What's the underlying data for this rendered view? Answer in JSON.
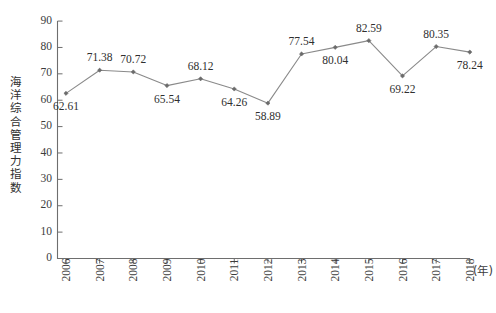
{
  "chart_data": {
    "type": "line",
    "title": "",
    "xlabel": "(年)",
    "ylabel": "海洋综合管理力指数",
    "categories": [
      "2006",
      "2007",
      "2008",
      "2009",
      "2010",
      "2011",
      "2012",
      "2013",
      "2014",
      "2015",
      "2016",
      "2017",
      "2018"
    ],
    "values": [
      62.61,
      71.38,
      70.72,
      65.54,
      68.12,
      64.26,
      58.89,
      77.54,
      80.04,
      82.59,
      69.22,
      80.35,
      78.24
    ],
    "point_labels": [
      "62.61",
      "71.38",
      "70.72",
      "65.54",
      "68.12",
      "64.26",
      "58.89",
      "77.54",
      "80.04",
      "82.59",
      "69.22",
      "80.35",
      "78.24"
    ],
    "label_positions": [
      "below",
      "above",
      "above",
      "below",
      "above",
      "below",
      "below",
      "above",
      "below",
      "above",
      "below",
      "above",
      "below"
    ],
    "ylim": [
      0,
      90
    ],
    "ytick_values": [
      0,
      10,
      20,
      30,
      40,
      50,
      60,
      70,
      80,
      90
    ],
    "ytick_labels": [
      "0",
      "10",
      "20",
      "30",
      "40",
      "50",
      "60",
      "70",
      "80",
      "90"
    ],
    "grid": false,
    "legend": "none",
    "series": [
      {
        "name": "海洋综合管理力指数",
        "values": [
          62.61,
          71.38,
          70.72,
          65.54,
          68.12,
          64.26,
          58.89,
          77.54,
          80.04,
          82.59,
          69.22,
          80.35,
          78.24
        ],
        "line_color": "#8a8a8a",
        "marker_color": "#6b6b6b"
      }
    ]
  },
  "colors": {
    "line": "#8a8a8a",
    "marker": "#6b6b6b",
    "axis": "#6e6e6e",
    "text": "#2f2f2f",
    "background": "#ffffff"
  }
}
